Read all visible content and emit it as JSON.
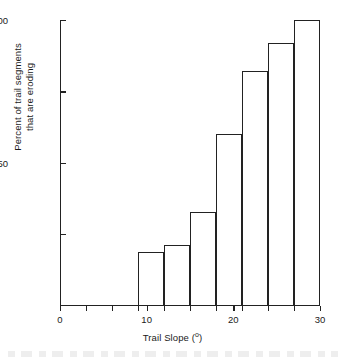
{
  "chart_data": {
    "type": "bar",
    "title": "",
    "subtitle": "",
    "xlabel": "Trail Slope (°)",
    "xlabel_text": "Trail Slope (",
    "xlabel_unit": "o",
    "xlabel_close": ")",
    "ylabel": "Percent of trail segments that are eroding",
    "ylabel_line1": "Percent of trail segments",
    "ylabel_line2": "that are eroding",
    "xlim": [
      0,
      30
    ],
    "ylim": [
      0,
      100
    ],
    "grid": false,
    "legend": "none",
    "bar_style": "outline",
    "bin_width": 3,
    "categories": [
      "9-12",
      "12-15",
      "15-18",
      "18-21",
      "21-24",
      "24-27",
      "27-30"
    ],
    "bin_edges": [
      9,
      12,
      15,
      18,
      21,
      24,
      27,
      30
    ],
    "values": [
      18.6,
      21.0,
      32.6,
      60.0,
      82.0,
      92.0,
      100.0
    ],
    "bars": [
      {
        "x0": 9,
        "x1": 12,
        "value": 18.6
      },
      {
        "x0": 12,
        "x1": 15,
        "value": 21.0
      },
      {
        "x0": 15,
        "x1": 18,
        "value": 32.6
      },
      {
        "x0": 18,
        "x1": 21,
        "value": 60.0
      },
      {
        "x0": 21,
        "x1": 24,
        "value": 82.0
      },
      {
        "x0": 24,
        "x1": 27,
        "value": 92.0
      },
      {
        "x0": 27,
        "x1": 30,
        "value": 100.0
      }
    ],
    "yticks": [
      {
        "value": 100,
        "label": "100"
      },
      {
        "value": 75,
        "label": ""
      },
      {
        "value": 50,
        "label": "50"
      },
      {
        "value": 25,
        "label": ""
      }
    ],
    "xticks": [
      {
        "value": 0,
        "label": "0"
      },
      {
        "value": 3,
        "label": ""
      },
      {
        "value": 6,
        "label": ""
      },
      {
        "value": 9,
        "label": ""
      },
      {
        "value": 10,
        "label": "10"
      },
      {
        "value": 12,
        "label": ""
      },
      {
        "value": 15,
        "label": ""
      },
      {
        "value": 18,
        "label": ""
      },
      {
        "value": 20,
        "label": "20"
      },
      {
        "value": 21,
        "label": ""
      },
      {
        "value": 24,
        "label": ""
      },
      {
        "value": 27,
        "label": ""
      },
      {
        "value": 30,
        "label": "30"
      }
    ],
    "colors": {
      "axis": "#222222",
      "bar_stroke": "#222222",
      "bar_fill": "#ffffff",
      "background": "#ffffff",
      "text": "#1a1a1a"
    }
  }
}
